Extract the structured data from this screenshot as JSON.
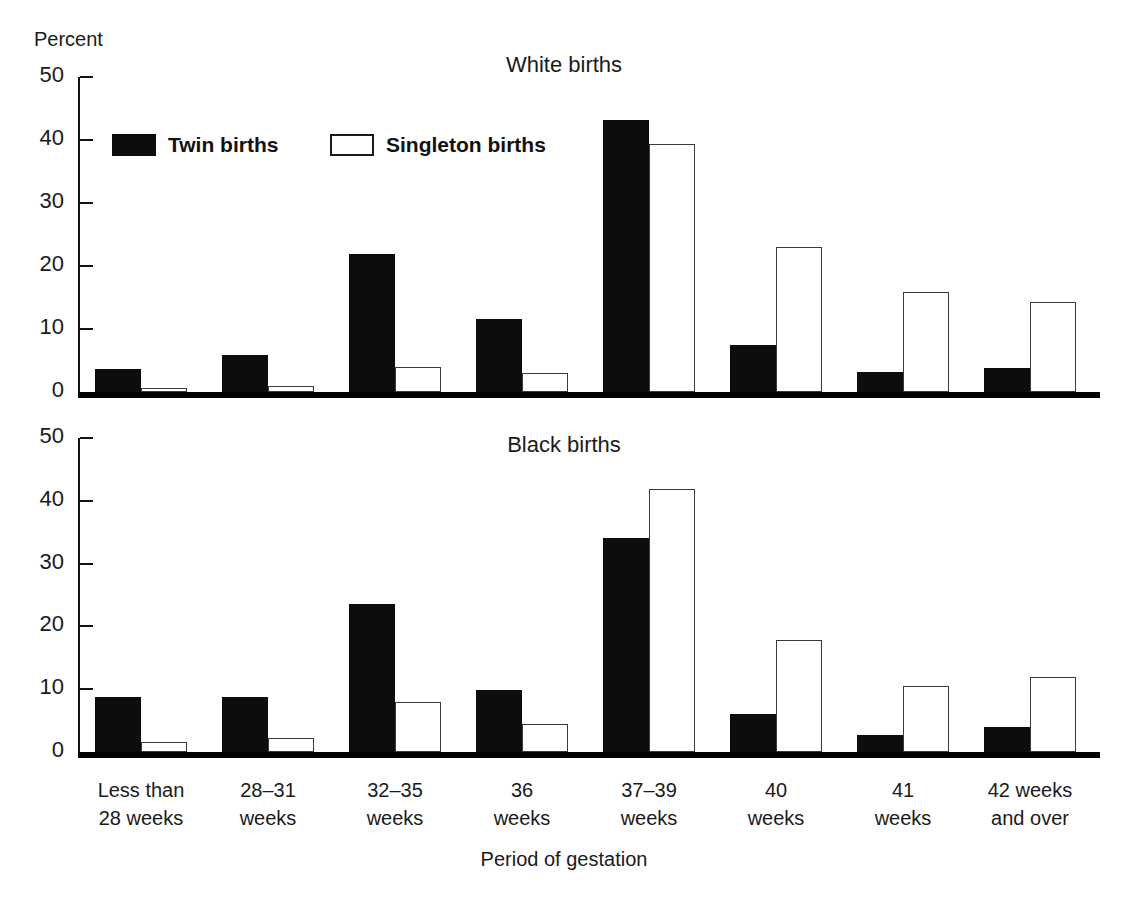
{
  "figure": {
    "y_unit_label": "Percent",
    "xaxis_title": "Period of gestation"
  },
  "legend": {
    "items": [
      {
        "label": "Twin births",
        "swatch": "filled-square-icon",
        "color": "#0d0d0d"
      },
      {
        "label": "Singleton births",
        "swatch": "outline-square-icon",
        "color": "#ffffff"
      }
    ]
  },
  "categories": [
    {
      "line1": "Less than",
      "line2": "28 weeks"
    },
    {
      "line1": "28–31",
      "line2": "weeks"
    },
    {
      "line1": "32–35",
      "line2": "weeks"
    },
    {
      "line1": "36",
      "line2": "weeks"
    },
    {
      "line1": "37–39",
      "line2": "weeks"
    },
    {
      "line1": "40",
      "line2": "weeks"
    },
    {
      "line1": "41",
      "line2": "weeks"
    },
    {
      "line1": "42 weeks",
      "line2": "and over"
    }
  ],
  "ytick_labels": [
    "0",
    "10",
    "20",
    "30",
    "40",
    "50"
  ],
  "chart_data": [
    {
      "type": "bar",
      "title": "White births",
      "xlabel": "Period of gestation",
      "ylabel": "Percent",
      "ylim": [
        0,
        50
      ],
      "yticks": [
        0,
        10,
        20,
        30,
        40,
        50
      ],
      "grid": false,
      "legend_position": "top-left-inside",
      "categories": [
        "Less than 28 weeks",
        "28–31 weeks",
        "32–35 weeks",
        "36 weeks",
        "37–39 weeks",
        "40 weeks",
        "41 weeks",
        "42 weeks and over"
      ],
      "series": [
        {
          "name": "Twin births",
          "values": [
            3.6,
            5.8,
            21.9,
            11.6,
            43.2,
            7.4,
            3.2,
            3.8
          ]
        },
        {
          "name": "Singleton births",
          "values": [
            0.6,
            0.9,
            4.0,
            3.0,
            39.4,
            23.0,
            15.9,
            14.3
          ]
        }
      ]
    },
    {
      "type": "bar",
      "title": "Black births",
      "xlabel": "Period of gestation",
      "ylabel": "Percent",
      "ylim": [
        0,
        50
      ],
      "yticks": [
        0,
        10,
        20,
        30,
        40,
        50
      ],
      "grid": false,
      "legend_position": "none",
      "categories": [
        "Less than 28 weeks",
        "28–31 weeks",
        "32–35 weeks",
        "36 weeks",
        "37–39 weeks",
        "40 weeks",
        "41 weeks",
        "42 weeks and over"
      ],
      "series": [
        {
          "name": "Twin births",
          "values": [
            8.8,
            8.8,
            23.5,
            9.9,
            34.0,
            6.0,
            2.7,
            4.0
          ]
        },
        {
          "name": "Singleton births",
          "values": [
            1.6,
            2.2,
            8.0,
            4.4,
            41.9,
            17.8,
            10.5,
            11.9
          ]
        }
      ]
    }
  ]
}
